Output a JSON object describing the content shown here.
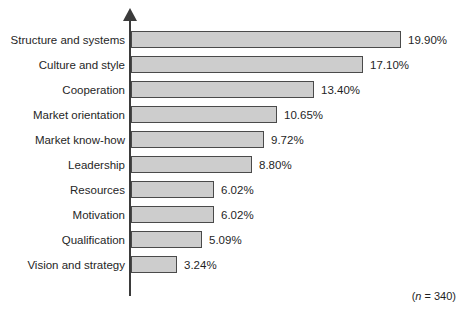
{
  "chart_data": {
    "type": "bar",
    "orientation": "horizontal",
    "title": "",
    "subtitle": "",
    "xlabel": "",
    "ylabel": "",
    "grid": false,
    "legend": null,
    "xlim": [
      0,
      21
    ],
    "value_suffix": "%",
    "categories": [
      "Structure and systems",
      "Culture and style",
      "Cooperation",
      "Market orientation",
      "Market know-how",
      "Leadership",
      "Resources",
      "Motivation",
      "Qualification",
      "Vision and strategy"
    ],
    "values": [
      19.9,
      17.1,
      13.4,
      10.65,
      9.72,
      8.8,
      6.02,
      6.02,
      5.09,
      3.24
    ],
    "value_labels": [
      "19.90%",
      "17.10%",
      "13.40%",
      "10.65%",
      "9.72%",
      "8.80%",
      "6.02%",
      "6.02%",
      "5.09%",
      "3.24%"
    ],
    "annotations": {
      "sample_size_prefix": "(",
      "sample_size_symbol": "n",
      "sample_size_text": " = 340)"
    },
    "colors": {
      "bar_fill": "#cdcdcd",
      "bar_stroke": "#4a4a4a",
      "axis": "#3b3b3b",
      "text": "#262626",
      "background": "#ffffff"
    }
  }
}
